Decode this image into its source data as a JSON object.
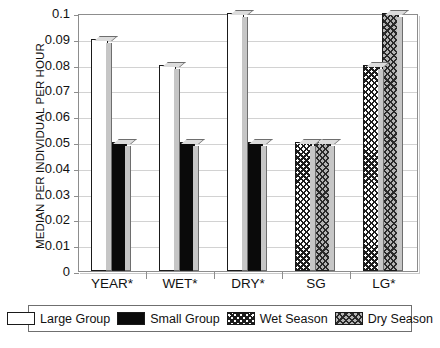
{
  "chart_data": {
    "type": "bar",
    "title": "",
    "xlabel": "",
    "ylabel": "MEDIAN PER INDIVIDUAL PER HOUR",
    "ylim": [
      0,
      0.1
    ],
    "ytick_labels": [
      "0.1",
      "0.09",
      "0.08",
      "0.07",
      "0.06",
      "0.05",
      "0.04",
      "0.03",
      "0.02",
      "0.01",
      "0"
    ],
    "ytick_values": [
      0.1,
      0.09,
      0.08,
      0.07,
      0.06,
      0.05,
      0.04,
      0.03,
      0.02,
      0.01,
      0
    ],
    "grid": true,
    "legend_position": "bottom",
    "categories": [
      "YEAR*",
      "WET*",
      "DRY*",
      "SG",
      "LG*"
    ],
    "series": [
      {
        "name": "Large Group",
        "pattern": "solid-white",
        "values": [
          0.09,
          0.08,
          0.1,
          null,
          null
        ]
      },
      {
        "name": "Small Group",
        "pattern": "solid-black",
        "values": [
          0.05,
          0.05,
          0.05,
          null,
          null
        ]
      },
      {
        "name": "Wet Season",
        "pattern": "diagonal-hatch-white",
        "values": [
          null,
          null,
          null,
          0.05,
          0.08
        ]
      },
      {
        "name": "Dry Season",
        "pattern": "diagonal-hatch-gray",
        "values": [
          null,
          null,
          null,
          0.05,
          0.1
        ]
      }
    ]
  },
  "legend": {
    "entries": [
      {
        "label": "Large Group",
        "swatch": "solid-white"
      },
      {
        "label": "Small Group",
        "swatch": "solid-black"
      },
      {
        "label": "Wet Season",
        "swatch": "diagonal-hatch-white"
      },
      {
        "label": "Dry Season",
        "swatch": "diagonal-hatch-gray"
      }
    ]
  },
  "colors": {
    "axis": "#8d8d8d",
    "grid": "#d2d2d2",
    "bar_outline": "#1a1a1a",
    "large_group": "#ffffff",
    "small_group": "#0a0a0a",
    "dry_season_bg": "#b4b4b4",
    "text": "#111111"
  }
}
